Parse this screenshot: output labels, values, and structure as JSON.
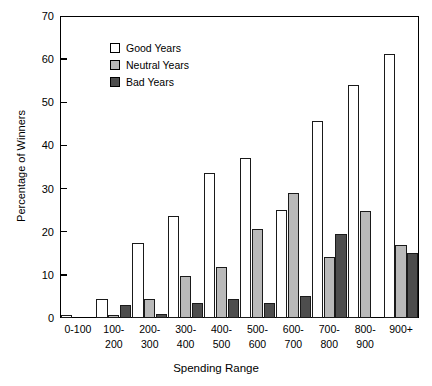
{
  "chart_data": {
    "type": "bar",
    "title": "",
    "subtitle": "",
    "xlabel": "Spending Range",
    "ylabel": "Percentage of Winners",
    "categories": [
      "0-100",
      "100-200",
      "200-300",
      "300-400",
      "400-500",
      "500-600",
      "600-700",
      "700-800",
      "800-900",
      "900+"
    ],
    "category_lines": [
      [
        "0-100"
      ],
      [
        "100-",
        "200"
      ],
      [
        "200-",
        "300"
      ],
      [
        "300-",
        "400"
      ],
      [
        "400-",
        "500"
      ],
      [
        "500-",
        "600"
      ],
      [
        "600-",
        "700"
      ],
      [
        "700-",
        "800"
      ],
      [
        "800-",
        "900"
      ],
      [
        "900+"
      ]
    ],
    "series": [
      {
        "name": "Good Years",
        "color": "#ffffff",
        "values": [
          0.7,
          4.3,
          17.4,
          23.6,
          33.6,
          37.0,
          25.0,
          45.7,
          54.0,
          61.2
        ]
      },
      {
        "name": "Neutral Years",
        "color": "#b9b9b9",
        "values": [
          0.0,
          0.8,
          4.3,
          9.7,
          11.8,
          20.7,
          29.0,
          14.1,
          24.8,
          17.0
        ]
      },
      {
        "name": "Bad Years",
        "color": "#4d4d4d",
        "values": [
          0.0,
          3.0,
          1.0,
          3.5,
          4.4,
          3.5,
          5.2,
          19.4,
          0.0,
          15.0
        ]
      }
    ],
    "ylim": [
      0,
      70
    ],
    "yticks": [
      0,
      10,
      20,
      30,
      40,
      50,
      60,
      70
    ],
    "grid": false,
    "legend_position": "top-left-inside"
  },
  "legend": {
    "entries": [
      {
        "label": "Good Years",
        "color": "#ffffff"
      },
      {
        "label": "Neutral Years",
        "color": "#b9b9b9"
      },
      {
        "label": "Bad Years",
        "color": "#4d4d4d"
      }
    ]
  }
}
